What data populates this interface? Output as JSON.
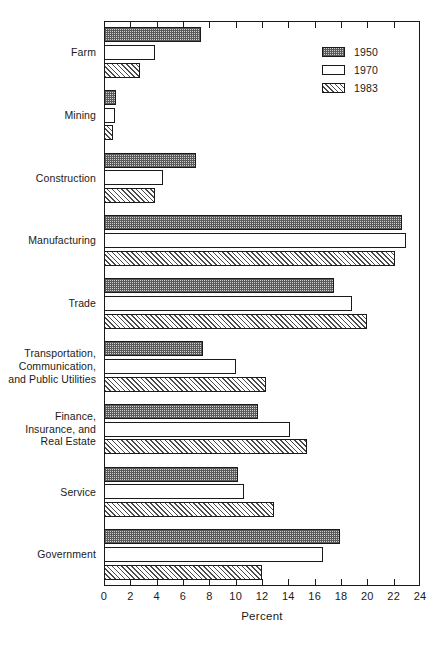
{
  "chart_data": {
    "type": "bar",
    "orientation": "horizontal",
    "title": "",
    "xlabel": "Percent",
    "ylabel": "",
    "xlim": [
      0,
      24
    ],
    "xticks": [
      0,
      2,
      4,
      6,
      8,
      10,
      12,
      14,
      16,
      18,
      20,
      22,
      24
    ],
    "grid": false,
    "legend_position": "top-right",
    "categories": [
      "Farm",
      "Mining",
      "Construction",
      "Manufacturing",
      "Trade",
      "Transportation,\nCommunication,\nand Public Utilities",
      "Finance,\nInsurance, and\nReal Estate",
      "Service",
      "Government"
    ],
    "series": [
      {
        "name": "1950",
        "pattern": "dotted",
        "values": [
          7.4,
          0.9,
          7.0,
          22.6,
          17.5,
          7.5,
          11.7,
          10.2,
          17.9
        ]
      },
      {
        "name": "1970",
        "pattern": "empty",
        "values": [
          3.9,
          0.8,
          4.5,
          22.9,
          18.8,
          10.0,
          14.1,
          10.6,
          16.6
        ]
      },
      {
        "name": "1983",
        "pattern": "hatched",
        "values": [
          2.7,
          0.7,
          3.9,
          22.1,
          20.0,
          12.3,
          15.4,
          12.9,
          12.0
        ]
      }
    ]
  },
  "legend": {
    "entries": [
      {
        "label": "1950"
      },
      {
        "label": "1970"
      },
      {
        "label": "1983"
      }
    ]
  },
  "axis": {
    "x_title": "Percent"
  }
}
